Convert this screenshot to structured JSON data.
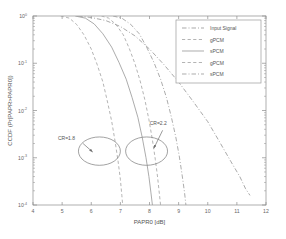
{
  "chart_data": {
    "type": "line",
    "title": "",
    "xlabel": "PAPR0 [dB]",
    "ylabel": "CCDF (Pr[PAPR>PAPR0])",
    "xlim": [
      4,
      12
    ],
    "ylim_exp": [
      -4,
      0
    ],
    "yscale": "log",
    "grid": false,
    "legend_position": "upper-right",
    "xticks": [
      "4",
      "5",
      "6",
      "7",
      "8",
      "9",
      "10",
      "11",
      "12"
    ],
    "xtick_values": [
      4,
      5,
      6,
      7,
      8,
      9,
      10,
      11,
      12
    ],
    "ytick_labels": [
      "10",
      "10",
      "10",
      "10",
      "10"
    ],
    "ytick_exponents": [
      "0",
      "-1",
      "-2",
      "-3",
      "-4"
    ],
    "ytick_values": [
      1,
      0.1,
      0.01,
      0.001,
      0.0001
    ],
    "series": [
      {
        "name": "Input Signal",
        "style": "dashdot",
        "color": "#9a9a9a",
        "points": [
          [
            5.55,
            1.0
          ],
          [
            6.0,
            0.93
          ],
          [
            6.5,
            0.8
          ],
          [
            7.0,
            0.6
          ],
          [
            7.5,
            0.38
          ],
          [
            8.0,
            0.2
          ],
          [
            8.5,
            0.093
          ],
          [
            9.0,
            0.04
          ],
          [
            9.5,
            0.0155
          ],
          [
            10.0,
            0.0058
          ],
          [
            10.4,
            0.0022
          ],
          [
            10.8,
            0.00082
          ],
          [
            11.1,
            0.0004
          ],
          [
            11.3,
            0.00022
          ],
          [
            11.45,
            0.00016
          ]
        ]
      },
      {
        "name": "gPCM",
        "style": "dashed",
        "color": "#a6a6a6",
        "points": [
          [
            4.95,
            1.0
          ],
          [
            5.25,
            0.9
          ],
          [
            5.5,
            0.66
          ],
          [
            5.75,
            0.4
          ],
          [
            6.0,
            0.2
          ],
          [
            6.2,
            0.095
          ],
          [
            6.4,
            0.04
          ],
          [
            6.55,
            0.016
          ],
          [
            6.7,
            0.006
          ],
          [
            6.82,
            0.0022
          ],
          [
            6.92,
            0.00085
          ],
          [
            7.0,
            0.00035
          ],
          [
            7.05,
            0.00016
          ],
          [
            7.08,
            0.0001
          ]
        ]
      },
      {
        "name": "sPCM",
        "style": "solid",
        "color": "#9d9d9d",
        "points": [
          [
            5.45,
            1.0
          ],
          [
            5.8,
            0.9
          ],
          [
            6.1,
            0.68
          ],
          [
            6.4,
            0.42
          ],
          [
            6.7,
            0.22
          ],
          [
            6.95,
            0.105
          ],
          [
            7.2,
            0.046
          ],
          [
            7.4,
            0.019
          ],
          [
            7.6,
            0.0072
          ],
          [
            7.75,
            0.0027
          ],
          [
            7.88,
            0.001
          ],
          [
            7.98,
            0.0004
          ],
          [
            8.05,
            0.00018
          ],
          [
            8.1,
            0.0001
          ]
        ]
      },
      {
        "name": "gPCM",
        "style": "dashed",
        "color": "#a6a6a6",
        "points": [
          [
            6.35,
            1.0
          ],
          [
            6.6,
            0.9
          ],
          [
            6.85,
            0.66
          ],
          [
            7.1,
            0.4
          ],
          [
            7.3,
            0.21
          ],
          [
            7.5,
            0.098
          ],
          [
            7.68,
            0.042
          ],
          [
            7.84,
            0.017
          ],
          [
            7.98,
            0.0064
          ],
          [
            8.1,
            0.0024
          ],
          [
            8.2,
            0.00092
          ],
          [
            8.28,
            0.00038
          ],
          [
            8.34,
            0.00017
          ],
          [
            8.38,
            0.0001
          ]
        ]
      },
      {
        "name": "sPCM",
        "style": "dashdot",
        "color": "#9d9d9d",
        "points": [
          [
            6.75,
            1.0
          ],
          [
            7.05,
            0.9
          ],
          [
            7.35,
            0.67
          ],
          [
            7.65,
            0.42
          ],
          [
            7.9,
            0.22
          ],
          [
            8.15,
            0.105
          ],
          [
            8.38,
            0.046
          ],
          [
            8.58,
            0.019
          ],
          [
            8.75,
            0.0073
          ],
          [
            8.9,
            0.0028
          ],
          [
            9.02,
            0.0011
          ],
          [
            9.12,
            0.00043
          ],
          [
            9.2,
            0.00019
          ],
          [
            9.25,
            0.0001
          ]
        ]
      }
    ],
    "annotations": [
      {
        "label": "CR=1.8",
        "label_x": 5.15,
        "label_y_exp": -2.62,
        "ellipse_cx": 6.28,
        "ellipse_cy_exp": -2.86,
        "ellipse_rx_data": 0.72,
        "ellipse_ry_exp": 0.3,
        "arrow_from_x": 5.72,
        "arrow_from_y_exp": -2.7,
        "arrow_to_x": 6.05,
        "arrow_to_y_exp": -2.88
      },
      {
        "label": "CR=2.2",
        "label_x": 8.3,
        "label_y_exp": -2.3,
        "ellipse_cx": 7.9,
        "ellipse_cy_exp": -2.86,
        "ellipse_rx_data": 0.72,
        "ellipse_ry_exp": 0.3,
        "arrow_from_x": 8.45,
        "arrow_from_y_exp": -2.42,
        "arrow_to_x": 8.15,
        "arrow_to_y_exp": -2.8
      }
    ],
    "legend_entries": [
      {
        "label": "Input Signal",
        "style": "dashdot",
        "color": "#9a9a9a"
      },
      {
        "label": "gPCM",
        "style": "dashed",
        "color": "#a6a6a6"
      },
      {
        "label": "sPCM",
        "style": "solid",
        "color": "#9d9d9d"
      },
      {
        "label": "gPCM",
        "style": "dashed",
        "color": "#a6a6a6"
      },
      {
        "label": "sPCM",
        "style": "dashdot",
        "color": "#9d9d9d"
      }
    ]
  },
  "colors": {
    "axis": "#8c8c8c",
    "text": "#666666",
    "background": "#ffffff",
    "legend_border": "#9a9a9a"
  }
}
